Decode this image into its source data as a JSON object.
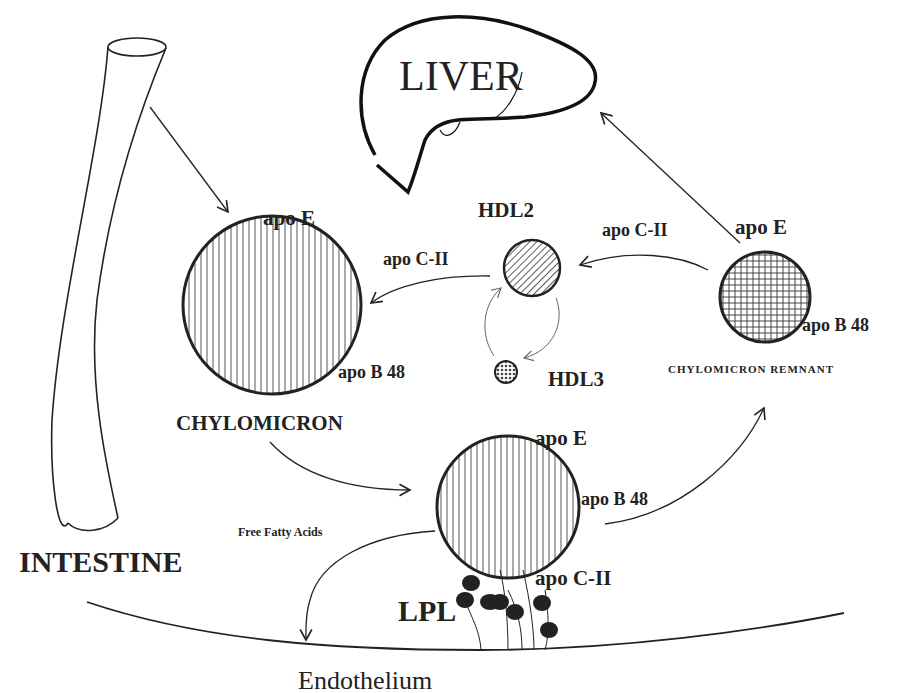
{
  "diagram": {
    "colors": {
      "ink": "#222222",
      "background": "#ffffff"
    },
    "organs": {
      "liver": {
        "label": "LIVER"
      },
      "intestine": {
        "label": "INTESTINE"
      }
    },
    "particles": {
      "chylomicron": {
        "label": "CHYLOMICRON",
        "apo_top": "apo E",
        "apo_side": "apo B 48",
        "pattern": "vertical-lines"
      },
      "hdl2": {
        "label": "HDL2",
        "pattern": "diagonal-lines"
      },
      "hdl3": {
        "label": "HDL3",
        "pattern": "dotted"
      },
      "remnant": {
        "label": "CHYLOMICRON REMNANT",
        "apo_top": "apo E",
        "apo_side": "apo B 48",
        "pattern": "crosshatch"
      },
      "capillary_chylomicron": {
        "apo_top": "apo E",
        "apo_side": "apo B 48",
        "apo_bottom": "apo C-II",
        "pattern": "vertical-lines"
      }
    },
    "transfers": {
      "hdl2_to_chylomicron": "apo C-II",
      "remnant_to_hdl2": "apo C-II"
    },
    "enzyme": {
      "label": "LPL"
    },
    "products": {
      "ffa": "Free Fatty Acids"
    },
    "bottom_label": "Endothelium"
  }
}
